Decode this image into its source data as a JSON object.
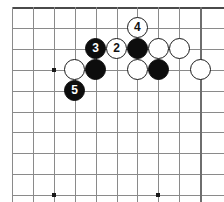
{
  "board": {
    "title": "go-board-diagram",
    "type": "go-game-diagram",
    "cols": 10,
    "rows": 10,
    "origin_x": 12,
    "origin_y": 7,
    "spacing": 20.9,
    "line_color": "#8a8a8a",
    "edge_color": "#4a4a4a",
    "background": "#ffffff",
    "black_color": "#0d0d0d",
    "white_color": "#ffffff",
    "stone_diameter": 21,
    "edges": [
      {
        "name": "top-edge",
        "side": "top"
      },
      {
        "name": "right-edge",
        "side": "right"
      }
    ],
    "hoshi": [
      {
        "col": 2,
        "row": 3
      },
      {
        "col": 7,
        "row": 3
      },
      {
        "col": 2,
        "row": 9
      },
      {
        "col": 7,
        "row": 9
      }
    ],
    "stones": [
      {
        "col": 6,
        "row": 1,
        "color": "white",
        "label": "4",
        "name": "stone-move-4"
      },
      {
        "col": 4,
        "row": 2,
        "color": "black",
        "label": "3",
        "name": "stone-move-3"
      },
      {
        "col": 5,
        "row": 2,
        "color": "white",
        "label": "2",
        "name": "stone-move-2"
      },
      {
        "col": 6,
        "row": 2,
        "color": "black",
        "label": "",
        "name": "stone-black-c6r2"
      },
      {
        "col": 7,
        "row": 2,
        "color": "white",
        "label": "",
        "name": "stone-white-c7r2"
      },
      {
        "col": 8,
        "row": 2,
        "color": "white",
        "label": "",
        "name": "stone-white-c8r2"
      },
      {
        "col": 3,
        "row": 3,
        "color": "white",
        "label": "",
        "name": "stone-white-c3r3"
      },
      {
        "col": 4,
        "row": 3,
        "color": "black",
        "label": "",
        "name": "stone-black-c4r3"
      },
      {
        "col": 6,
        "row": 3,
        "color": "white",
        "label": "",
        "name": "stone-white-c6r3"
      },
      {
        "col": 7,
        "row": 3,
        "color": "black",
        "label": "",
        "name": "stone-black-c7r3"
      },
      {
        "col": 9,
        "row": 3,
        "color": "white",
        "label": "",
        "name": "stone-white-c9r3"
      },
      {
        "col": 3,
        "row": 4,
        "color": "black",
        "label": "5",
        "name": "stone-move-5"
      }
    ]
  }
}
